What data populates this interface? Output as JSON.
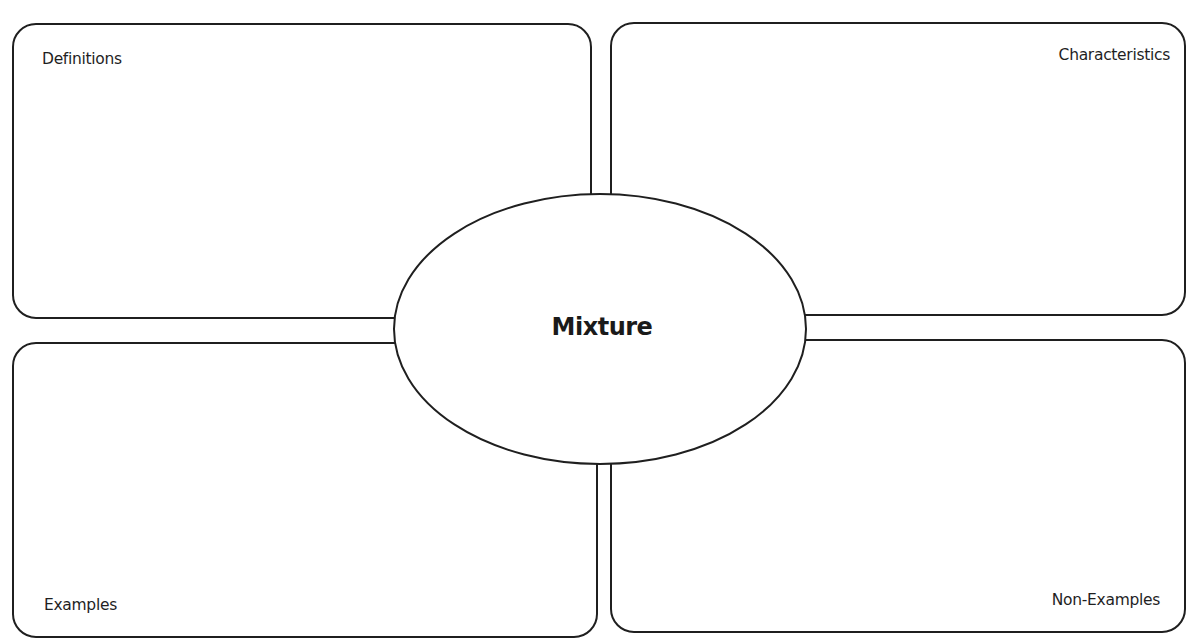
{
  "diagram": {
    "type": "frayer-model",
    "center": {
      "label": "Mixture"
    },
    "quadrants": [
      {
        "position": "top-left",
        "label": "Definitions"
      },
      {
        "position": "top-right",
        "label": "Characteristics"
      },
      {
        "position": "bottom-left",
        "label": "Examples"
      },
      {
        "position": "bottom-right",
        "label": "Non-Examples"
      }
    ],
    "colors": {
      "stroke": "#1f1f1f",
      "background": "#ffffff",
      "text": "#1a1a1a"
    }
  }
}
